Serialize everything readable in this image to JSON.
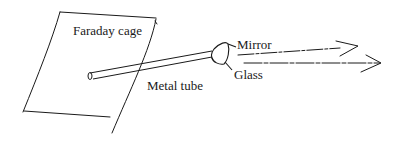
{
  "diagram": {
    "labels": {
      "faraday_cage": "Faraday cage",
      "metal_tube": "Metal tube",
      "mirror": "Mirror",
      "glass": "Glass"
    },
    "colors": {
      "stroke": "#1a1a1a",
      "background": "#ffffff"
    }
  }
}
